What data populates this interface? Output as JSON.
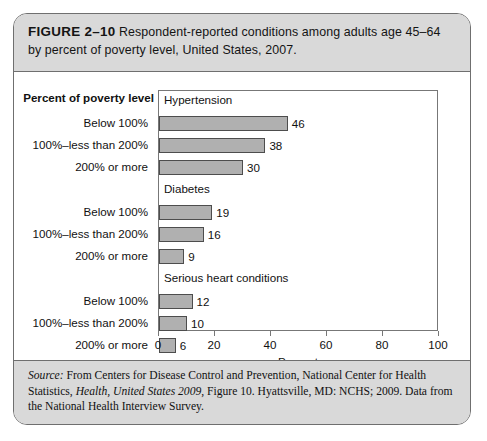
{
  "figure": {
    "number": "FIGURE 2–10",
    "caption": " Respondent-reported conditions among adults age 45–64 by percent of poverty level, United States, 2007.",
    "source_prefix": "Source:",
    "source_part1": " From Centers for Disease Control and Prevention, National Center for Health Statistics, ",
    "source_italic1": "Health, United States 2009",
    "source_part2": ", Figure 10. Hyattsville, MD: NCHS; 2009. Data from the National Health Interview Survey."
  },
  "chart_data": {
    "type": "bar",
    "orientation": "horizontal",
    "title": "Respondent-reported conditions among adults age 45–64 by percent of poverty level, United States, 2007.",
    "xlabel": "Percent",
    "ylabel": "Percent of poverty level",
    "xlim": [
      0,
      100
    ],
    "xticks": [
      0,
      20,
      40,
      60,
      80,
      100
    ],
    "xticklabels": [
      "0",
      "20",
      "40",
      "60",
      "80",
      "100"
    ],
    "grid": false,
    "legend": "none",
    "categories": [
      "Below 100%",
      "100%–less than 200%",
      "200% or more"
    ],
    "groups": [
      {
        "name": "Hypertension",
        "bars": [
          {
            "category": "Below 100%",
            "value": 46,
            "label": "46"
          },
          {
            "category": "100%–less than 200%",
            "value": 38,
            "label": "38"
          },
          {
            "category": "200% or more",
            "value": 30,
            "label": "30"
          }
        ]
      },
      {
        "name": "Diabetes",
        "bars": [
          {
            "category": "Below 100%",
            "value": 19,
            "label": "19"
          },
          {
            "category": "100%–less than 200%",
            "value": 16,
            "label": "16"
          },
          {
            "category": "200% or more",
            "value": 9,
            "label": "9"
          }
        ]
      },
      {
        "name": "Serious heart conditions",
        "bars": [
          {
            "category": "Below 100%",
            "value": 12,
            "label": "12"
          },
          {
            "category": "100%–less than 200%",
            "value": 10,
            "label": "10"
          },
          {
            "category": "200% or more",
            "value": 6,
            "label": "6"
          }
        ]
      }
    ],
    "colors": {
      "bar_fill": "#b0b0b0",
      "bar_stroke": "#4d4d4d",
      "frame": "#777777",
      "band_background": "#d9d9d9",
      "border": "#6f6f6f"
    }
  }
}
